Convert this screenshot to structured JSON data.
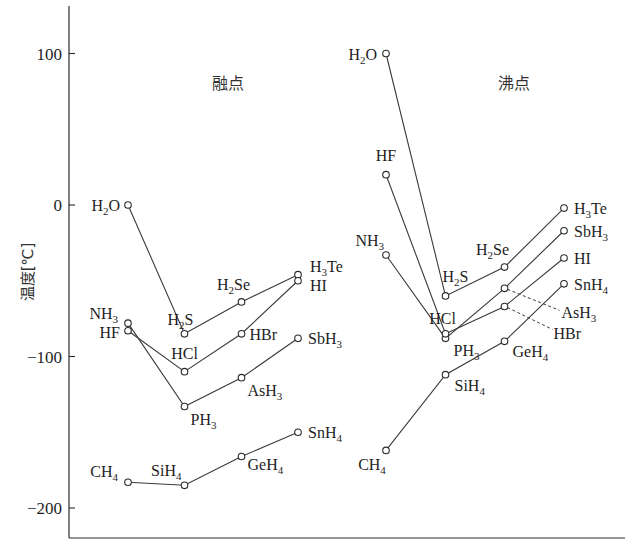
{
  "chart_data": {
    "type": "line",
    "title": "",
    "ylabel": "温度[℃]",
    "xlabel": "",
    "ylim": [
      -220,
      135
    ],
    "yticks": [
      100,
      0,
      -100,
      -200
    ],
    "yticks_label": [
      "100",
      "0",
      "−100",
      "−200"
    ],
    "grid": false,
    "panels": [
      {
        "name": "melting",
        "title": "融点",
        "series": [
          {
            "name": "group14",
            "points": [
              {
                "label": "CH4",
                "period": 2,
                "value": -183
              },
              {
                "label": "SiH4",
                "period": 3,
                "value": -185
              },
              {
                "label": "GeH4",
                "period": 4,
                "value": -166
              },
              {
                "label": "SnH4",
                "period": 5,
                "value": -150
              }
            ]
          },
          {
            "name": "group15",
            "points": [
              {
                "label": "NH3",
                "period": 2,
                "value": -78
              },
              {
                "label": "PH3",
                "period": 3,
                "value": -133
              },
              {
                "label": "AsH3",
                "period": 4,
                "value": -114
              },
              {
                "label": "SbH3",
                "period": 5,
                "value": -88
              }
            ]
          },
          {
            "name": "group16",
            "points": [
              {
                "label": "H2O",
                "period": 2,
                "value": 0
              },
              {
                "label": "H2S",
                "period": 3,
                "value": -85
              },
              {
                "label": "H2Se",
                "period": 4,
                "value": -64
              },
              {
                "label": "H3Te",
                "period": 5,
                "value": -46
              }
            ]
          },
          {
            "name": "group17",
            "points": [
              {
                "label": "HF",
                "period": 2,
                "value": -83
              },
              {
                "label": "HCl",
                "period": 3,
                "value": -110
              },
              {
                "label": "HBr",
                "period": 4,
                "value": -85
              },
              {
                "label": "HI",
                "period": 5,
                "value": -50
              }
            ]
          }
        ]
      },
      {
        "name": "boiling",
        "title": "沸点",
        "series": [
          {
            "name": "group14",
            "points": [
              {
                "label": "CH4",
                "period": 2,
                "value": -162
              },
              {
                "label": "SiH4",
                "period": 3,
                "value": -112
              },
              {
                "label": "GeH4",
                "period": 4,
                "value": -90
              },
              {
                "label": "SnH4",
                "period": 5,
                "value": -52
              }
            ]
          },
          {
            "name": "group15",
            "points": [
              {
                "label": "NH3",
                "period": 2,
                "value": -33
              },
              {
                "label": "PH3",
                "period": 3,
                "value": -88
              },
              {
                "label": "AsH3",
                "period": 4,
                "value": -55
              },
              {
                "label": "SbH3",
                "period": 5,
                "value": -17
              }
            ]
          },
          {
            "name": "group16",
            "points": [
              {
                "label": "H2O",
                "period": 2,
                "value": 100
              },
              {
                "label": "H2S",
                "period": 3,
                "value": -60
              },
              {
                "label": "H2Se",
                "period": 4,
                "value": -41
              },
              {
                "label": "H3Te",
                "period": 5,
                "value": -2
              }
            ]
          },
          {
            "name": "group17",
            "points": [
              {
                "label": "HF",
                "period": 2,
                "value": 20
              },
              {
                "label": "HCl",
                "period": 3,
                "value": -85
              },
              {
                "label": "HBr",
                "period": 4,
                "value": -67
              },
              {
                "label": "HI",
                "period": 5,
                "value": -35
              }
            ]
          }
        ]
      }
    ]
  }
}
